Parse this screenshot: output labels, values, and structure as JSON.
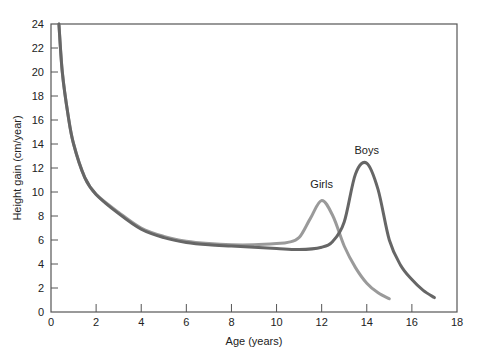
{
  "chart_data": {
    "type": "line",
    "title": "",
    "xlabel": "Age (years)",
    "ylabel": "Height gain (cm/year)",
    "xlim": [
      0,
      18
    ],
    "ylim": [
      0,
      24
    ],
    "xticks": [
      0,
      2,
      4,
      6,
      8,
      10,
      12,
      14,
      16,
      18
    ],
    "yticks": [
      0,
      2,
      4,
      6,
      8,
      10,
      12,
      14,
      16,
      18,
      20,
      22,
      24
    ],
    "grid": false,
    "legend": "none (inline annotations)",
    "annotations": [
      {
        "text": "Girls",
        "x": 12,
        "y": 10.3
      },
      {
        "text": "Boys",
        "x": 14,
        "y": 13.2
      }
    ],
    "series": [
      {
        "name": "Girls",
        "color": "#9a9a9a",
        "x": [
          0.35,
          0.5,
          0.75,
          1,
          1.5,
          2,
          3,
          4,
          5,
          6,
          7,
          8,
          9,
          10,
          10.5,
          11,
          11.5,
          12,
          12.5,
          13,
          13.5,
          14,
          14.5,
          15
        ],
        "y": [
          24,
          20,
          16.5,
          14,
          11.2,
          9.8,
          8.3,
          7.0,
          6.3,
          5.9,
          5.7,
          5.6,
          5.6,
          5.7,
          5.8,
          6.2,
          7.8,
          9.3,
          8.0,
          5.5,
          3.7,
          2.4,
          1.6,
          1.1
        ]
      },
      {
        "name": "Boys",
        "color": "#666666",
        "x": [
          0.35,
          0.5,
          0.75,
          1,
          1.5,
          2,
          3,
          4,
          5,
          6,
          7,
          8,
          9,
          10,
          11,
          12,
          12.5,
          13,
          13.5,
          14,
          14.5,
          15,
          15.5,
          16,
          16.5,
          17
        ],
        "y": [
          24,
          20,
          16.5,
          14,
          11.2,
          9.8,
          8.2,
          6.9,
          6.2,
          5.8,
          5.6,
          5.5,
          5.4,
          5.3,
          5.2,
          5.4,
          5.9,
          7.5,
          11.5,
          12.4,
          10.2,
          6.0,
          3.9,
          2.7,
          1.8,
          1.2
        ]
      }
    ]
  }
}
